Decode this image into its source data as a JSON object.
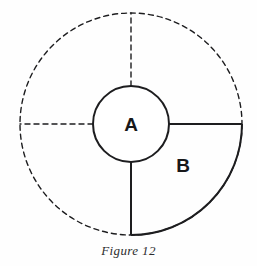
{
  "figure": {
    "caption": "Figure 12",
    "background_color": "#fefefe",
    "stroke_color": "#1d1d1f",
    "labels": {
      "inner_circle": "A",
      "sector": "B"
    },
    "geometry": {
      "center_x": 131,
      "center_y": 124,
      "outer_radius": 111,
      "inner_radius": 38,
      "sector_start_angle_deg": 0,
      "sector_end_angle_deg": 90,
      "dashed_radius_angles_deg": [
        90,
        180
      ],
      "label_a_x": 131,
      "label_a_y": 131,
      "label_b_x": 183,
      "label_b_y": 172
    }
  }
}
